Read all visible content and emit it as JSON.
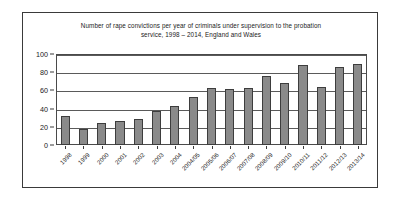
{
  "chart_data": {
    "type": "bar",
    "title": "Number of rape convictions per year of criminals under supervision to the probation service, 1998 – 2014, England and Wales",
    "title_lines": [
      "Number of rape convictions per year of criminals under supervision to the probation",
      "service, 1998 – 2014, England and Wales"
    ],
    "xlabel": "",
    "ylabel": "",
    "ylim": [
      0,
      100
    ],
    "yticks": [
      0,
      20,
      40,
      60,
      80,
      100
    ],
    "ytick_labels": [
      "0",
      "20",
      "40",
      "60",
      "80",
      "100"
    ],
    "grid": true,
    "legend": false,
    "categories": [
      "1998",
      "1999",
      "2000",
      "2001",
      "2002",
      "2003",
      "2004",
      "2004/05",
      "2005/06",
      "2006/07",
      "2007/08",
      "2008/09",
      "2009/10",
      "2010/11",
      "2011/12",
      "2012/13",
      "2013/14"
    ],
    "values": [
      32,
      18,
      24,
      26,
      29,
      37,
      43,
      53,
      63,
      62,
      63,
      76,
      68,
      88,
      64,
      86,
      89
    ],
    "series": [
      {
        "name": "Rape convictions",
        "values": [
          32,
          18,
          24,
          26,
          29,
          37,
          43,
          53,
          63,
          62,
          63,
          76,
          68,
          88,
          64,
          86,
          89
        ],
        "color": "#8a8a8a",
        "edge_color": "#3d3d3d"
      }
    ]
  },
  "colors": {
    "bar_fill": "#8a8a8a",
    "bar_edge": "#3d3d3d",
    "gridline": "#5a5a5a",
    "frame": "#3a3a3a",
    "background": "#ffffff",
    "text": "#1a1a1a"
  }
}
